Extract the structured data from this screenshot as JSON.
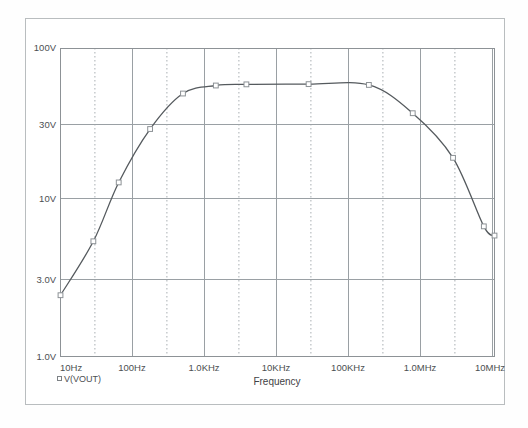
{
  "app": {
    "window_title": "Probe Waveform Plot"
  },
  "chart_data": {
    "type": "line",
    "title": "",
    "subtitle": "",
    "xlabel": "Frequency",
    "ylabel": "",
    "xscale": "log",
    "yscale": "log",
    "xlim": [
      10,
      20000000
    ],
    "ylim": [
      1,
      100
    ],
    "grid": true,
    "grid_major_color": "#9aa0a4",
    "grid_minor_style": "dotted",
    "legend_position": "below-left",
    "x_tick_labels": [
      "10Hz",
      "100Hz",
      "1.0KHz",
      "10KHz",
      "100KHz",
      "1.0MHz",
      "10MHz"
    ],
    "x_tick_values": [
      10,
      100,
      1000,
      10000,
      100000,
      1000000,
      10000000
    ],
    "y_tick_labels": [
      "100V",
      "30V",
      "10V",
      "3.0V",
      "1.0V"
    ],
    "y_tick_values": [
      100,
      30,
      10,
      3,
      1
    ],
    "series": [
      {
        "name": "V(VOUT)",
        "marker": "square",
        "color": "#555a5e",
        "marker_color": "#8d9296",
        "x": [
          10,
          30,
          70,
          200,
          600,
          1800,
          5000,
          40000,
          300000,
          1300000,
          5000000,
          14000000,
          20000000
        ],
        "y": [
          2.5,
          5.6,
          13.5,
          30.0,
          51.0,
          57.5,
          58.5,
          58.7,
          58.0,
          38.0,
          19.5,
          7.0,
          6.1
        ]
      }
    ],
    "annotations": []
  },
  "legend": {
    "entries": [
      {
        "marker": "square-marker",
        "label": "V(VOUT)"
      }
    ]
  },
  "axes": {
    "x_title": "Frequency",
    "y_title": ""
  }
}
